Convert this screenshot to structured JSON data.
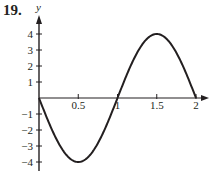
{
  "problem_number": "19.",
  "chart_data": {
    "type": "line",
    "title": "",
    "xlabel": "",
    "ylabel": "y",
    "function": "y = -4 sin(pi x)",
    "x_ticks": [
      "0.5",
      "1",
      "1.5",
      "2"
    ],
    "y_ticks": [
      "4",
      "3",
      "2",
      "1",
      "-1",
      "-2",
      "-3",
      "-4"
    ],
    "xlim": [
      0,
      2
    ],
    "ylim": [
      -4,
      4
    ],
    "grid": false,
    "series": [
      {
        "name": "curve",
        "x": [
          0,
          0.25,
          0.5,
          0.75,
          1,
          1.25,
          1.5,
          1.75,
          2
        ],
        "y": [
          0,
          -2.83,
          -4,
          -2.83,
          0,
          2.83,
          4,
          2.83,
          0
        ]
      }
    ],
    "color": "#231f20"
  }
}
